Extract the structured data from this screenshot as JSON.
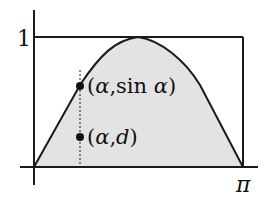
{
  "figure": {
    "colors": {
      "background": "#ffffff",
      "fill_under_curve": "#e3e3e3",
      "stroke": "#1a1a1a"
    },
    "axes": {
      "y_tick_label": "1",
      "x_tick_label": "π"
    },
    "points": [
      {
        "label": "(α,sin α)",
        "label_open": "(",
        "alpha": "α",
        "comma": ",",
        "fn": "sin ",
        "alpha2": "α",
        "label_close": ")"
      },
      {
        "label": "(α,d)",
        "label_open": "(",
        "alpha": "α",
        "comma": ",",
        "var": "d",
        "label_close": ")"
      }
    ],
    "elements": {
      "bounding_rectangle": "box from (0,0) to (π,1)",
      "curve": "y = sin x approximated by a rounded trapezoid",
      "dashed_line": "vertical dotted line at x = α"
    }
  }
}
